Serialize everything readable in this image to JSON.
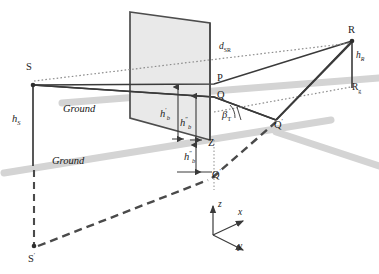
{
  "figure": {
    "type": "technical-geometry-diagram"
  },
  "labels": {
    "source": "S",
    "source_image": "S",
    "source_image_prime": "′",
    "source_height": "h",
    "source_height_sub": "S",
    "receiver": "R",
    "receiver_height": "h",
    "receiver_height_sub": "R",
    "receiver_ground": "R",
    "receiver_ground_sub": "g",
    "point_p": "P",
    "point_q": "Q",
    "point_q_prime": "Q",
    "point_q_prime_mark": "′",
    "point_q_lower": "Q",
    "point_q_lower_mark": "′",
    "point_z": "Z",
    "distance_sr": "d",
    "distance_sr_sub": "SR",
    "hb_prime": "h",
    "hb_prime_sub": "b",
    "hb_prime_mark": "′",
    "hb_dprime": "h",
    "hb_dprime_sub": "b",
    "hb_dprime_mark": "″",
    "hb_dprime_lower": "h",
    "hb_dprime_lower_sub": "b",
    "hb_dprime_lower_mark": "″",
    "beta": "β",
    "beta_sub": "T",
    "ground_upper": "Ground",
    "ground_lower": "Ground",
    "axis_z": "z",
    "axis_x": "x",
    "axis_y": "y"
  },
  "colors": {
    "line_dark": "#3a3a3a",
    "line_dark_strong": "#2e2e2e",
    "facade_fill": "#e8e8e8",
    "facade_stroke": "#4a4a4a",
    "ground_band": "#d2d2d2",
    "dotted": "#8a8a8a",
    "dashed": "#555555",
    "text": "#1c1c1c",
    "background": "#ffffff"
  },
  "geometry": {
    "points": {
      "S": [
        33,
        85
      ],
      "Sprime": [
        34,
        247
      ],
      "P": [
        214,
        84
      ],
      "Q": [
        214,
        97
      ],
      "Z": [
        214,
        142
      ],
      "Qlower": [
        214,
        172
      ],
      "Qprime": [
        276,
        120
      ],
      "R": [
        352,
        41
      ],
      "Rg": [
        352,
        88
      ]
    },
    "facade_quad": [
      [
        130,
        12
      ],
      [
        210,
        23
      ],
      [
        210,
        140
      ],
      [
        130,
        118
      ]
    ],
    "axis_origin": [
      213,
      235
    ],
    "axis_z_tip": [
      213,
      205
    ],
    "axis_x_tip": [
      245,
      220
    ],
    "axis_y_tip": [
      245,
      250
    ]
  },
  "annotations": {
    "hb_prime_arrow": "vertical double arrow between Q-level and facade base",
    "hb_dprime_arrow": "vertical double arrow between Q-level and Z",
    "hb_dprime_lower_arrow": "vertical double arrow between Z and Q-lower",
    "hS_line": "vertical solid line from S down to ground level",
    "hR_line": "vertical solid line from R down to Rg"
  }
}
